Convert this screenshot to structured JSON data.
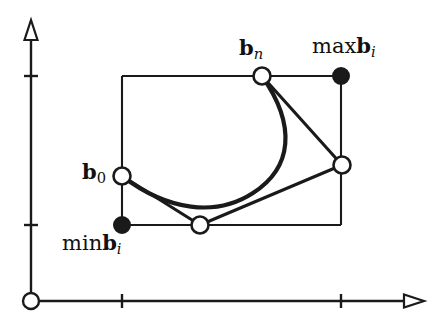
{
  "figure": {
    "width": 443,
    "height": 328,
    "background_color": "#ffffff",
    "stroke_color": "#1a1a1a",
    "labels": {
      "b_n": {
        "base": "b",
        "sub": "n",
        "text": "bn"
      },
      "max_b_i": {
        "op": "max",
        "base": "b",
        "sub": "i",
        "text": "maxbi"
      },
      "b_0": {
        "base": "b",
        "sub": "0",
        "text": "b0"
      },
      "min_b_i": {
        "op": "min",
        "base": "b",
        "sub": "i",
        "text": "minbi"
      }
    },
    "axes": {
      "origin": {
        "x": 31,
        "y": 301
      },
      "x_axis": {
        "x1": 31,
        "y1": 301,
        "x2": 413,
        "y2": 301,
        "arrow": "open-triangle-right"
      },
      "y_axis": {
        "x1": 31,
        "y1": 301,
        "x2": 31,
        "y2": 28,
        "arrow": "open-triangle-up"
      },
      "x_ticks": [
        122,
        341
      ],
      "y_ticks": [
        76,
        225
      ]
    },
    "bounding_box": {
      "left": 122,
      "top": 76,
      "right": 341,
      "bottom": 225
    },
    "control_points": [
      {
        "name": "b_0",
        "x": 122,
        "y": 176,
        "marker": "open"
      },
      {
        "name": "b_1",
        "x": 200,
        "y": 225,
        "marker": "open"
      },
      {
        "name": "b_2",
        "x": 342,
        "y": 165,
        "marker": "open"
      },
      {
        "name": "b_n",
        "x": 262,
        "y": 76,
        "marker": "open"
      }
    ],
    "extreme_points": [
      {
        "name": "min_b_i",
        "x": 122,
        "y": 225,
        "marker": "filled"
      },
      {
        "name": "max_b_i",
        "x": 341,
        "y": 76,
        "marker": "filled"
      }
    ],
    "control_polygon_path": "M 122 176 L 200 225 L 342 165 L 262 76",
    "curve_path": "M 122 176 C 168 210 214 217 252 194 C 290 170 297 127 262 76"
  }
}
